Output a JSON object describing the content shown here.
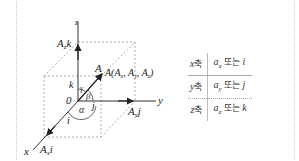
{
  "diagram": {
    "axes": {
      "x_label": "x",
      "y_label": "y",
      "z_label": "z",
      "origin_label": "0"
    },
    "vector": {
      "name": "A",
      "point_label": "A(A",
      "components_text": "A(Aₓ, Aᵧ, A_z)"
    },
    "component_labels": {
      "x": "Aₓi",
      "y": "Aᵧj",
      "z": "A_zk"
    },
    "unit_vectors": {
      "i": "i",
      "j": "j",
      "k": "k"
    },
    "angles": {
      "alpha": "α",
      "beta": "β",
      "gamma": "γ"
    },
    "colors": {
      "line": "#333333",
      "dashed": "#999999",
      "arrow": "#222222"
    }
  },
  "table": {
    "rows": [
      {
        "axis": "x",
        "axis_suffix": "축",
        "unit_a": "a",
        "unit_a_sub": "x",
        "or": "또는",
        "unit": "i"
      },
      {
        "axis": "y",
        "axis_suffix": "축",
        "unit_a": "a",
        "unit_a_sub": "y",
        "or": "또는",
        "unit": "j"
      },
      {
        "axis": "z",
        "axis_suffix": "축",
        "unit_a": "a",
        "unit_a_sub": "z",
        "or": "또는",
        "unit": "k"
      }
    ]
  }
}
